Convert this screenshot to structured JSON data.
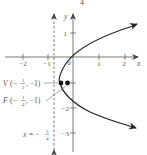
{
  "header": {
    "fragment": "4"
  },
  "axes": {
    "x_label": "x",
    "y_label": "y",
    "x_ticks": [
      "−2",
      "−1",
      "0",
      "1",
      "2"
    ],
    "y_ticks": [
      "1",
      "−2",
      "−3"
    ]
  },
  "points": {
    "vertex": {
      "name": "V",
      "x": "−1/2",
      "y": "−1"
    },
    "focus": {
      "name": "F",
      "x": "−1/4",
      "y": "−1"
    }
  },
  "directrix": {
    "label": "x = −",
    "num": "3",
    "den": "4"
  },
  "curve": {
    "type": "parabola",
    "opens": "right",
    "equation": "(y+1)^2 = x + 1/2",
    "color": "#222222"
  }
}
